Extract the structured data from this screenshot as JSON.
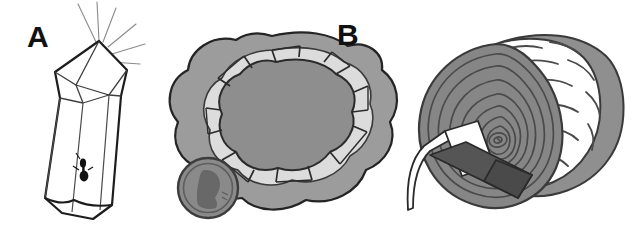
{
  "figure": {
    "background_color": "#ffffff",
    "width": 636,
    "height": 240,
    "panel_count": 3
  },
  "panels": [
    {
      "id": "a",
      "label": "A",
      "subject": "terminated-quartz-crystal-with-inclusion",
      "elements": {
        "crystal_name": "hexagonal prism crystal",
        "sparkle_name": "sparkle-rays",
        "sparkle_ray_count": 5,
        "inclusion_name": "dark insect inclusion"
      },
      "colors": {
        "crystal_fill": "#ffffff",
        "outline": "#1a1a1a",
        "facet_line": "#555555",
        "sparkle_line": "#777777",
        "inclusion": "#111111"
      }
    },
    {
      "id": "b",
      "label": "B",
      "subject": "geode-cross-section-with-coin-for-scale",
      "elements": {
        "outer_rind_name": "outer rock rind",
        "inner_band_name": "light chalcedony band",
        "cavity_name": "crystal-lined cavity",
        "crystal_teeth_name": "cavity crystal facets",
        "crystal_teeth_count": 14,
        "scale_object_name": "penny coin for scale",
        "coin_profile_name": "Lincoln profile silhouette"
      },
      "colors": {
        "outer_rind": "#9c9c9c",
        "inner_band": "#dcdcdc",
        "cavity": "#8e8e8e",
        "tooth_fill": "#d2d2d2",
        "outline": "#2b2b2b",
        "coin_fill": "#8a8a8a",
        "coin_rim": "#4f4f4f",
        "coin_profile": "#6a6a6a"
      }
    },
    {
      "id": "c",
      "label": "C",
      "subject": "petrified-log-with-rock-hammer-for-scale",
      "elements": {
        "log_end_name": "log cut end with growth rings",
        "log_side_name": "log bark side",
        "growth_ring_count": 9,
        "bark_striation_count": 11,
        "pith_name": "pith center",
        "scale_object_name": "rock hammer for scale",
        "hammer_head_name": "hammer head with pick",
        "hammer_handle_name": "hammer handle"
      },
      "colors": {
        "log_end": "#868686",
        "log_side": "#8f8f8f",
        "ring_line": "#4a4a4a",
        "bark_line": "#4a4a4a",
        "outline": "#3c3c3c",
        "hammer_head": "#ffffff",
        "hammer_handle": "#555555",
        "hammer_outline": "#2a2a2a"
      }
    }
  ]
}
